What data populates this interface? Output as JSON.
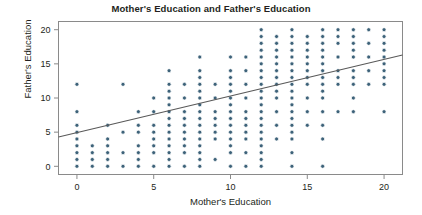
{
  "chart_data": {
    "type": "scatter",
    "title": "Mother's Education and Father's Education",
    "xlabel": "Mother's Education",
    "ylabel": "Father's Education",
    "xlim": [
      -1.2,
      21.2
    ],
    "ylim": [
      -1.2,
      21.2
    ],
    "xticks": [
      0,
      5,
      10,
      15,
      20
    ],
    "yticks": [
      0,
      5,
      10,
      15,
      20
    ],
    "xticklabels": [
      "0",
      "5",
      "10",
      "15",
      "20"
    ],
    "yticklabels": [
      "0",
      "5",
      "10",
      "15",
      "20"
    ],
    "grid": false,
    "legend": null,
    "marker_color": "#3d6279",
    "marker_size": 4,
    "frame_color": "#8a8a8a",
    "trendline": {
      "type": "linear-fit",
      "color": "#595959",
      "x_start": -1.2,
      "y_start": 4.3,
      "x_end": 21.2,
      "y_end": 16.3,
      "slope": 0.536,
      "intercept": 4.94
    },
    "points": [
      [
        0,
        0
      ],
      [
        0,
        1
      ],
      [
        0,
        2
      ],
      [
        0,
        3
      ],
      [
        0,
        4
      ],
      [
        0,
        5
      ],
      [
        0,
        6
      ],
      [
        0,
        8
      ],
      [
        0,
        12
      ],
      [
        1,
        0
      ],
      [
        1,
        1
      ],
      [
        1,
        2
      ],
      [
        1,
        3
      ],
      [
        2,
        0
      ],
      [
        2,
        1
      ],
      [
        2,
        2
      ],
      [
        2,
        3
      ],
      [
        2,
        4
      ],
      [
        2,
        6
      ],
      [
        3,
        0
      ],
      [
        3,
        2
      ],
      [
        3,
        5
      ],
      [
        3,
        12
      ],
      [
        4,
        0
      ],
      [
        4,
        1
      ],
      [
        4,
        2
      ],
      [
        4,
        3
      ],
      [
        4,
        5
      ],
      [
        4,
        6
      ],
      [
        4,
        8
      ],
      [
        5,
        0
      ],
      [
        5,
        2
      ],
      [
        5,
        3
      ],
      [
        5,
        4
      ],
      [
        5,
        5
      ],
      [
        5,
        6
      ],
      [
        5,
        8
      ],
      [
        5,
        10
      ],
      [
        6,
        0
      ],
      [
        6,
        1
      ],
      [
        6,
        2
      ],
      [
        6,
        3
      ],
      [
        6,
        4
      ],
      [
        6,
        5
      ],
      [
        6,
        6
      ],
      [
        6,
        7
      ],
      [
        6,
        8
      ],
      [
        6,
        9
      ],
      [
        6,
        10
      ],
      [
        6,
        11
      ],
      [
        6,
        12
      ],
      [
        6,
        14
      ],
      [
        7,
        0
      ],
      [
        7,
        2
      ],
      [
        7,
        3
      ],
      [
        7,
        4
      ],
      [
        7,
        5
      ],
      [
        7,
        6
      ],
      [
        7,
        7
      ],
      [
        7,
        8
      ],
      [
        7,
        10
      ],
      [
        7,
        12
      ],
      [
        8,
        0
      ],
      [
        8,
        1
      ],
      [
        8,
        2
      ],
      [
        8,
        3
      ],
      [
        8,
        4
      ],
      [
        8,
        5
      ],
      [
        8,
        6
      ],
      [
        8,
        7
      ],
      [
        8,
        8
      ],
      [
        8,
        9
      ],
      [
        8,
        10
      ],
      [
        8,
        11
      ],
      [
        8,
        12
      ],
      [
        8,
        13
      ],
      [
        8,
        14
      ],
      [
        8,
        16
      ],
      [
        9,
        1
      ],
      [
        9,
        4
      ],
      [
        9,
        5
      ],
      [
        9,
        6
      ],
      [
        9,
        7
      ],
      [
        9,
        8
      ],
      [
        9,
        10
      ],
      [
        9,
        12
      ],
      [
        10,
        0
      ],
      [
        10,
        2
      ],
      [
        10,
        3
      ],
      [
        10,
        4
      ],
      [
        10,
        5
      ],
      [
        10,
        6
      ],
      [
        10,
        7
      ],
      [
        10,
        8
      ],
      [
        10,
        9
      ],
      [
        10,
        10
      ],
      [
        10,
        11
      ],
      [
        10,
        12
      ],
      [
        10,
        13
      ],
      [
        10,
        14
      ],
      [
        10,
        16
      ],
      [
        11,
        0
      ],
      [
        11,
        2
      ],
      [
        11,
        4
      ],
      [
        11,
        5
      ],
      [
        11,
        6
      ],
      [
        11,
        7
      ],
      [
        11,
        8
      ],
      [
        11,
        10
      ],
      [
        11,
        12
      ],
      [
        11,
        14
      ],
      [
        11,
        16
      ],
      [
        12,
        0
      ],
      [
        12,
        1
      ],
      [
        12,
        2
      ],
      [
        12,
        3
      ],
      [
        12,
        4
      ],
      [
        12,
        5
      ],
      [
        12,
        6
      ],
      [
        12,
        7
      ],
      [
        12,
        8
      ],
      [
        12,
        9
      ],
      [
        12,
        10
      ],
      [
        12,
        11
      ],
      [
        12,
        12
      ],
      [
        12,
        13
      ],
      [
        12,
        14
      ],
      [
        12,
        15
      ],
      [
        12,
        16
      ],
      [
        12,
        17
      ],
      [
        12,
        18
      ],
      [
        12,
        19
      ],
      [
        12,
        20
      ],
      [
        13,
        4
      ],
      [
        13,
        6
      ],
      [
        13,
        8
      ],
      [
        13,
        10
      ],
      [
        13,
        11
      ],
      [
        13,
        12
      ],
      [
        13,
        13
      ],
      [
        13,
        14
      ],
      [
        13,
        15
      ],
      [
        13,
        16
      ],
      [
        13,
        17
      ],
      [
        13,
        18
      ],
      [
        13,
        19
      ],
      [
        14,
        0
      ],
      [
        14,
        2
      ],
      [
        14,
        4
      ],
      [
        14,
        5
      ],
      [
        14,
        6
      ],
      [
        14,
        7
      ],
      [
        14,
        8
      ],
      [
        14,
        9
      ],
      [
        14,
        10
      ],
      [
        14,
        11
      ],
      [
        14,
        12
      ],
      [
        14,
        13
      ],
      [
        14,
        14
      ],
      [
        14,
        15
      ],
      [
        14,
        16
      ],
      [
        14,
        17
      ],
      [
        14,
        18
      ],
      [
        14,
        19
      ],
      [
        14,
        20
      ],
      [
        15,
        6
      ],
      [
        15,
        8
      ],
      [
        15,
        10
      ],
      [
        15,
        12
      ],
      [
        15,
        13
      ],
      [
        15,
        14
      ],
      [
        15,
        15
      ],
      [
        15,
        16
      ],
      [
        15,
        17
      ],
      [
        15,
        18
      ],
      [
        15,
        19
      ],
      [
        16,
        0
      ],
      [
        16,
        4
      ],
      [
        16,
        6
      ],
      [
        16,
        8
      ],
      [
        16,
        10
      ],
      [
        16,
        11
      ],
      [
        16,
        12
      ],
      [
        16,
        13
      ],
      [
        16,
        14
      ],
      [
        16,
        15
      ],
      [
        16,
        16
      ],
      [
        16,
        17
      ],
      [
        16,
        18
      ],
      [
        16,
        19
      ],
      [
        16,
        20
      ],
      [
        17,
        8
      ],
      [
        17,
        12
      ],
      [
        17,
        13
      ],
      [
        17,
        14
      ],
      [
        17,
        16
      ],
      [
        17,
        18
      ],
      [
        17,
        19
      ],
      [
        17,
        20
      ],
      [
        18,
        8
      ],
      [
        18,
        10
      ],
      [
        18,
        12
      ],
      [
        18,
        13
      ],
      [
        18,
        14
      ],
      [
        18,
        16
      ],
      [
        18,
        17
      ],
      [
        18,
        18
      ],
      [
        18,
        19
      ],
      [
        18,
        20
      ],
      [
        19,
        12
      ],
      [
        19,
        14
      ],
      [
        19,
        16
      ],
      [
        19,
        18
      ],
      [
        19,
        20
      ],
      [
        20,
        8
      ],
      [
        20,
        12
      ],
      [
        20,
        13
      ],
      [
        20,
        14
      ],
      [
        20,
        15
      ],
      [
        20,
        16
      ],
      [
        20,
        17
      ],
      [
        20,
        18
      ],
      [
        20,
        19
      ],
      [
        20,
        20
      ]
    ]
  }
}
